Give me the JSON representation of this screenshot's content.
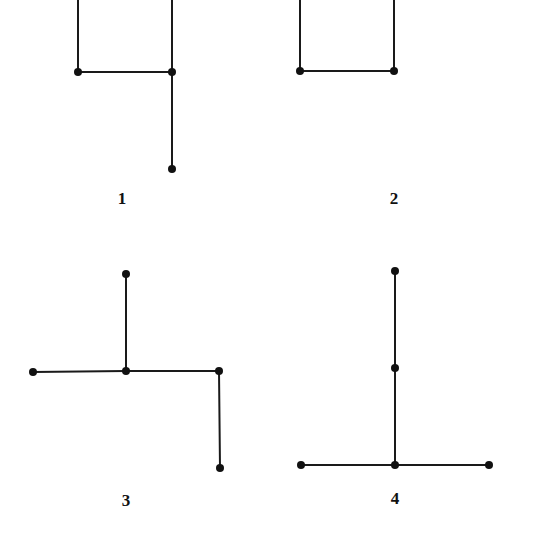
{
  "figures": [
    {
      "label": "1",
      "label_pos": [
        122,
        204
      ],
      "nodes": [
        [
          78,
          72
        ],
        [
          172,
          72
        ],
        [
          172,
          169
        ]
      ],
      "edges": [
        [
          [
            78,
            0
          ],
          [
            78,
            72
          ]
        ],
        [
          [
            172,
            0
          ],
          [
            172,
            72
          ]
        ],
        [
          [
            78,
            72
          ],
          [
            172,
            72
          ]
        ],
        [
          [
            172,
            72
          ],
          [
            172,
            169
          ]
        ]
      ]
    },
    {
      "label": "2",
      "label_pos": [
        394,
        204
      ],
      "nodes": [
        [
          300,
          71
        ],
        [
          394,
          71
        ]
      ],
      "edges": [
        [
          [
            300,
            0
          ],
          [
            300,
            71
          ]
        ],
        [
          [
            394,
            0
          ],
          [
            394,
            71
          ]
        ],
        [
          [
            300,
            71
          ],
          [
            394,
            71
          ]
        ]
      ]
    },
    {
      "label": "3",
      "label_pos": [
        126,
        506
      ],
      "nodes": [
        [
          126,
          274
        ],
        [
          33,
          372
        ],
        [
          126,
          371
        ],
        [
          219,
          371
        ],
        [
          220,
          468
        ]
      ],
      "edges": [
        [
          [
            126,
            274
          ],
          [
            126,
            371
          ]
        ],
        [
          [
            33,
            372
          ],
          [
            126,
            371
          ]
        ],
        [
          [
            126,
            371
          ],
          [
            219,
            371
          ]
        ],
        [
          [
            219,
            371
          ],
          [
            220,
            468
          ]
        ]
      ]
    },
    {
      "label": "4",
      "label_pos": [
        395,
        504
      ],
      "nodes": [
        [
          395,
          271
        ],
        [
          395,
          368
        ],
        [
          301,
          465
        ],
        [
          395,
          465
        ],
        [
          489,
          465
        ]
      ],
      "edges": [
        [
          [
            395,
            271
          ],
          [
            395,
            368
          ]
        ],
        [
          [
            395,
            368
          ],
          [
            395,
            465
          ]
        ],
        [
          [
            301,
            465
          ],
          [
            395,
            465
          ]
        ],
        [
          [
            395,
            465
          ],
          [
            489,
            465
          ]
        ]
      ]
    }
  ],
  "colors": {
    "stroke": "#1a1a1a",
    "node": "#111111",
    "background": "#ffffff"
  }
}
